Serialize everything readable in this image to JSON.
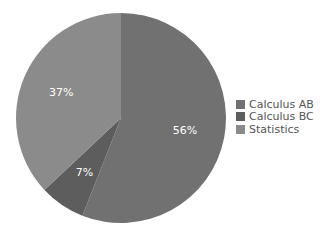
{
  "chart_data": {
    "type": "pie",
    "title": "",
    "legend_position": "right",
    "slices": [
      {
        "label": "Calculus AB",
        "value": 56,
        "data_label": "56%",
        "color": "#717171"
      },
      {
        "label": "Calculus BC",
        "value": 7,
        "data_label": "7%",
        "color": "#5d5d5d"
      },
      {
        "label": "Statistics",
        "value": 37,
        "data_label": "37%",
        "color": "#8b8b8b"
      }
    ],
    "start_angle": "12 o'clock",
    "direction": "clockwise"
  }
}
